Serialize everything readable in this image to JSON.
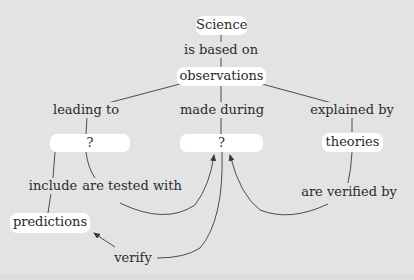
{
  "diagram": {
    "type": "concept-map",
    "nodes": {
      "science": "Science",
      "observations": "observations",
      "unknown_left": "?",
      "unknown_middle": "?",
      "theories": "theories",
      "predictions": "predictions"
    },
    "links": {
      "is_based_on": "is based on",
      "leading_to": "leading to",
      "made_during": "made during",
      "explained_by": "explained by",
      "include": "include",
      "are_tested_with": "are tested with",
      "are_verified_by": "are verified by",
      "verify": "verify"
    },
    "colors": {
      "background": "#e3e3e3",
      "node_fill": "#ffffff",
      "line": "#3a3a3a"
    }
  }
}
